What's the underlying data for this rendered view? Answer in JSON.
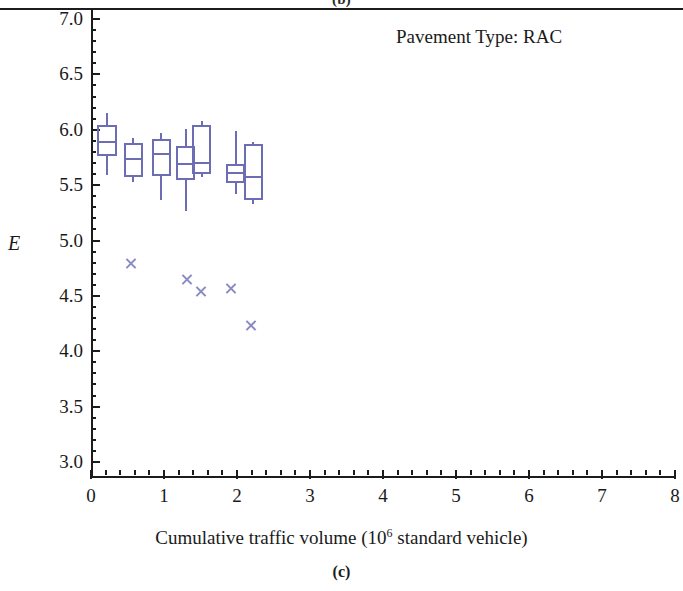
{
  "figure": {
    "top_cropped_label": "(b)",
    "panel_label": "(c)",
    "annotation": "Pavement Type: RAC",
    "annotation_x_px": 396,
    "annotation_y_px": 26
  },
  "axes": {
    "y_title": "E",
    "x_title_prefix": "Cumulative traffic volume (10",
    "x_title_exponent": "6",
    "x_title_suffix": " standard vehicle)",
    "y_ticks": [
      "3.0",
      "3.5",
      "4.0",
      "4.5",
      "5.0",
      "5.5",
      "6.0",
      "6.5",
      "7.0"
    ],
    "x_ticks": [
      "0",
      "1",
      "2",
      "3",
      "4",
      "5",
      "6",
      "7",
      "8"
    ]
  },
  "chart_data": {
    "type": "box",
    "title": "Pavement Type: RAC",
    "xlabel": "Cumulative traffic volume (10^6 standard vehicle)",
    "ylabel": "E",
    "xlim": [
      0,
      8.2
    ],
    "ylim": [
      3.0,
      7.15
    ],
    "grid": false,
    "legend": "none",
    "series_color": "#6d6db6",
    "boxes": [
      {
        "x": 0.22,
        "width": 0.28,
        "whisker_low": 5.59,
        "q1": 5.76,
        "median": 5.89,
        "q3": 6.04,
        "whisker_high": 6.15
      },
      {
        "x": 0.58,
        "width": 0.26,
        "whisker_low": 5.53,
        "q1": 5.57,
        "median": 5.74,
        "q3": 5.88,
        "whisker_high": 5.93
      },
      {
        "x": 0.96,
        "width": 0.26,
        "whisker_low": 5.37,
        "q1": 5.58,
        "median": 5.78,
        "q3": 5.92,
        "whisker_high": 5.97
      },
      {
        "x": 1.3,
        "width": 0.26,
        "whisker_low": 5.27,
        "q1": 5.55,
        "median": 5.69,
        "q3": 5.85,
        "whisker_high": 6.01
      },
      {
        "x": 1.52,
        "width": 0.26,
        "whisker_low": 5.57,
        "q1": 5.6,
        "median": 5.7,
        "q3": 6.04,
        "whisker_high": 6.08
      },
      {
        "x": 1.98,
        "width": 0.26,
        "whisker_low": 5.42,
        "q1": 5.52,
        "median": 5.61,
        "q3": 5.69,
        "whisker_high": 5.99
      },
      {
        "x": 2.22,
        "width": 0.26,
        "whisker_low": 5.33,
        "q1": 5.37,
        "median": 5.57,
        "q3": 5.87,
        "whisker_high": 5.89
      }
    ],
    "outliers": [
      {
        "x": 0.55,
        "y": 4.79
      },
      {
        "x": 1.31,
        "y": 4.65
      },
      {
        "x": 1.51,
        "y": 4.54
      },
      {
        "x": 1.92,
        "y": 4.57
      },
      {
        "x": 2.19,
        "y": 4.23
      }
    ]
  }
}
